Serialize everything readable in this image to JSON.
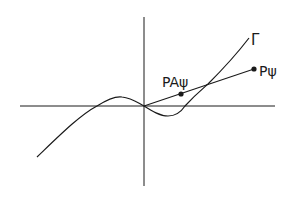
{
  "diagram": {
    "colors": {
      "stroke": "#1a1a1a",
      "background": "#ffffff"
    },
    "axes": {
      "horizontal": {
        "x1": 20,
        "x2": 275,
        "y": 106
      },
      "vertical": {
        "x": 144,
        "y1": 17,
        "y2": 186
      }
    },
    "curve": {
      "label": "Γ",
      "path": "M37,157 C60,135 80,115 97,106 C108,99 115,96 122,97 C132,98 138,103 144,106 C152,111 160,116 168,116 C176,116 181,112 185,106 C195,95 200,91 208,84 C222,70 236,55 249,38"
    },
    "line": {
      "from": [
        144,
        106
      ],
      "to": [
        254,
        69
      ]
    },
    "points": [
      {
        "name": "P",
        "label": "Pψ",
        "x": 254,
        "y": 69,
        "label_x": 259,
        "label_y": 76
      },
      {
        "name": "PA",
        "label": "PAψ",
        "x": 181,
        "y": 94,
        "label_x": 162,
        "label_y": 87
      }
    ],
    "curve_label_pos": {
      "x": 251,
      "y": 45
    }
  }
}
